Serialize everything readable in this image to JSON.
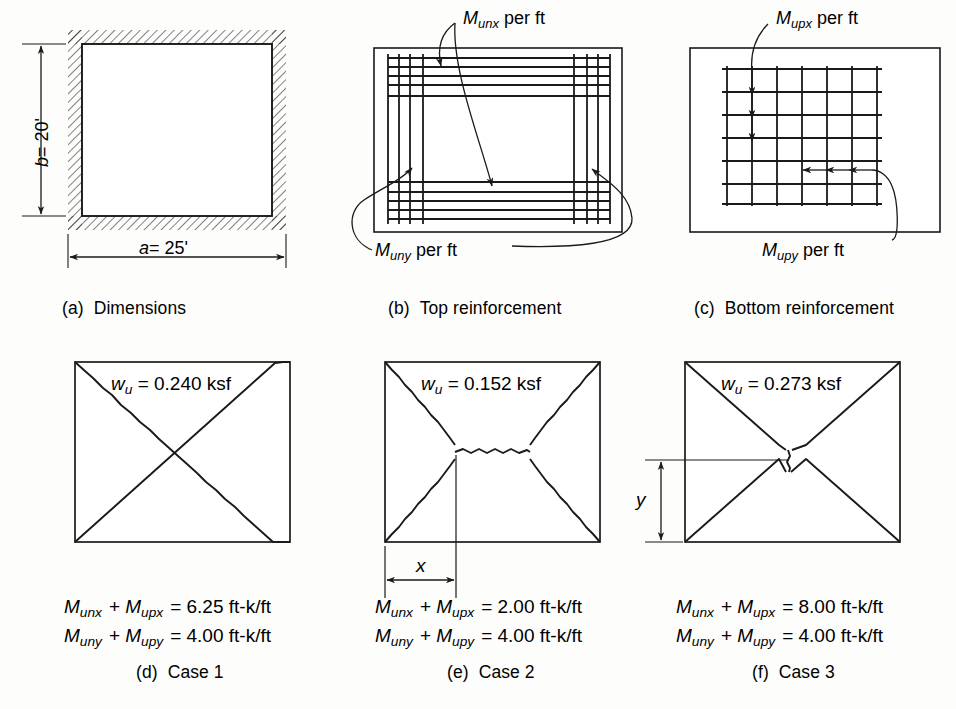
{
  "figure": {
    "background_color": "#fdfdfc",
    "ink_color": "#1a1a1a"
  },
  "panels": [
    {
      "id": "a",
      "caption": "(a)  Dimensions",
      "caption_prefix": "(a)",
      "caption_text": "Dimensions",
      "dimension_width_label": "a = 25'",
      "dimension_width_symbol": "a",
      "dimension_width_value": "= 25'",
      "dimension_height_label": "b = 20'",
      "dimension_height_symbol": "b",
      "dimension_height_value": "= 20'",
      "edge_condition": "fixed-hatched-all-sides"
    },
    {
      "id": "b",
      "caption": "(b)  Top reinforcement",
      "caption_prefix": "(b)",
      "caption_text": "Top reinforcement",
      "label_x_symbol": "M",
      "label_x_sub": "unx",
      "label_x_suffix": "per ft",
      "label_y_symbol": "M",
      "label_y_sub": "uny",
      "label_y_suffix": "per ft",
      "bars_top_horizontal": 5,
      "bars_bottom_horizontal": 5,
      "bars_left_vertical": 4,
      "bars_right_vertical": 4
    },
    {
      "id": "c",
      "caption": "(c)  Bottom reinforcement",
      "caption_prefix": "(c)",
      "caption_text": "Bottom reinforcement",
      "label_x_symbol": "M",
      "label_x_sub": "upx",
      "label_x_suffix": "per ft",
      "label_y_symbol": "M",
      "label_y_sub": "upy",
      "label_y_suffix": "per ft",
      "grid_vertical_lines": 7,
      "grid_horizontal_lines": 7
    },
    {
      "id": "d",
      "caption": "(d)  Case 1",
      "caption_prefix": "(d)",
      "caption_text": "Case 1",
      "load_symbol": "w",
      "load_sub": "u",
      "load_value": "= 0.240 ksf",
      "eq1_lhs_m1": "M",
      "eq1_lhs_m1_sub": "unx",
      "eq1_lhs_m2": "M",
      "eq1_lhs_m2_sub": "upx",
      "eq1_rhs": "= 6.25 ft-k/ft",
      "eq2_lhs_m1": "M",
      "eq2_lhs_m1_sub": "uny",
      "eq2_lhs_m2": "M",
      "eq2_lhs_m2_sub": "upy",
      "eq2_rhs": "= 4.00 ft-k/ft",
      "yield_pattern": "full-diagonal-x"
    },
    {
      "id": "e",
      "caption": "(e)  Case 2",
      "caption_prefix": "(e)",
      "caption_text": "Case 2",
      "load_symbol": "w",
      "load_sub": "u",
      "load_value": "= 0.152 ksf",
      "eq1_lhs_m1": "M",
      "eq1_lhs_m1_sub": "unx",
      "eq1_lhs_m2": "M",
      "eq1_lhs_m2_sub": "upx",
      "eq1_rhs": "= 2.00 ft-k/ft",
      "eq2_lhs_m1": "M",
      "eq2_lhs_m1_sub": "uny",
      "eq2_lhs_m2": "M",
      "eq2_lhs_m2_sub": "upy",
      "eq2_rhs": "= 4.00 ft-k/ft",
      "dimension_label": "x",
      "yield_pattern": "trapezoidal-horizontal-ridge"
    },
    {
      "id": "f",
      "caption": "(f)  Case 3",
      "caption_prefix": "(f)",
      "caption_text": "Case 3",
      "load_symbol": "w",
      "load_sub": "u",
      "load_value": "= 0.273 ksf",
      "eq1_lhs_m1": "M",
      "eq1_lhs_m1_sub": "unx",
      "eq1_lhs_m2": "M",
      "eq1_lhs_m2_sub": "upx",
      "eq1_rhs": "= 8.00 ft-k/ft",
      "eq2_lhs_m1": "M",
      "eq2_lhs_m1_sub": "uny",
      "eq2_lhs_m2": "M",
      "eq2_lhs_m2_sub": "upy",
      "eq2_rhs": "= 4.00 ft-k/ft",
      "dimension_label": "y",
      "yield_pattern": "vertical-ridge-x"
    }
  ]
}
